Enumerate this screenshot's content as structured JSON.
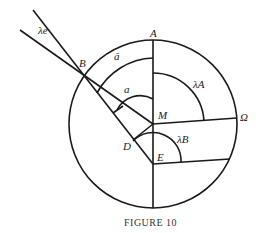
{
  "figure": {
    "caption": "FIGURE 10",
    "labels": {
      "lambda_e": "λe",
      "B": "B",
      "a_bar": "ā",
      "A": "A",
      "a": "a",
      "lambda_A": "λA",
      "M": "M",
      "Omega": "Ω",
      "D": "D",
      "lambda_B": "λB",
      "E": "E"
    }
  }
}
